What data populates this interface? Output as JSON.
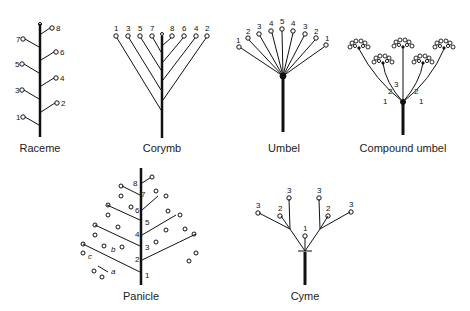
{
  "diagrams": [
    {
      "id": "raceme",
      "label": "Raceme",
      "flower_numbers": [
        "1",
        "2",
        "3",
        "4",
        "5",
        "6",
        "7",
        "8"
      ]
    },
    {
      "id": "corymb",
      "label": "Corymb",
      "flower_numbers": [
        "1",
        "3",
        "5",
        "7",
        "8",
        "6",
        "4",
        "2"
      ]
    },
    {
      "id": "umbel",
      "label": "Umbel",
      "flower_numbers": [
        "1",
        "2",
        "3",
        "4",
        "5",
        "4",
        "3",
        "2",
        "1"
      ]
    },
    {
      "id": "compound-umbel",
      "label": "Compound umbel",
      "branch_numbers": [
        "1",
        "2",
        "3",
        "2",
        "1"
      ]
    },
    {
      "id": "panicle",
      "label": "Panicle",
      "node_numbers": [
        "1",
        "2",
        "3",
        "4",
        "5",
        "6",
        "7",
        "8"
      ],
      "branch_letters": [
        "a",
        "b",
        "c"
      ]
    },
    {
      "id": "cyme",
      "label": "Cyme",
      "flower_numbers": [
        "3",
        "2",
        "3",
        "1",
        "3",
        "2",
        "3"
      ]
    }
  ]
}
